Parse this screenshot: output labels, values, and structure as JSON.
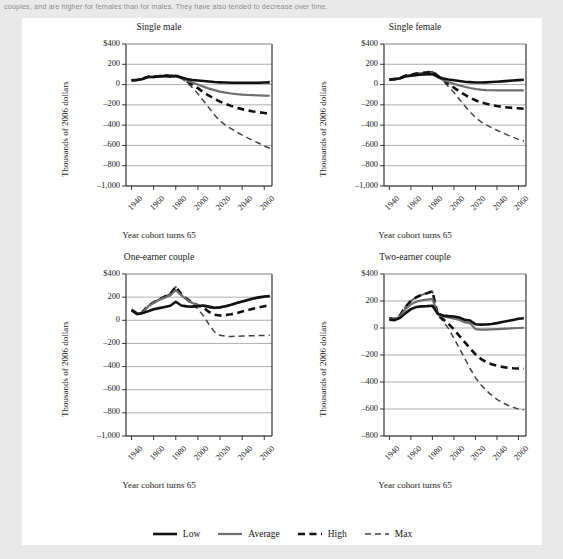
{
  "caption": "couples, and are higher for females than for males. They have also tended to decrease over time.",
  "colors": {
    "page_background": "#e9e9e9",
    "panel_background": "#ffffff",
    "low": "#111111",
    "average": "#6f6f6f",
    "high": "#111111",
    "max": "#444444",
    "gridline": "#9a9a9a",
    "axis": "#222222"
  },
  "legend": {
    "position": "bottom-center",
    "items": [
      {
        "label": "Low",
        "style": "solid",
        "width": 2.6,
        "color": "#111111"
      },
      {
        "label": "Average",
        "style": "solid",
        "width": 2.2,
        "color": "#6f6f6f"
      },
      {
        "label": "High",
        "style": "dashed",
        "width": 2.6,
        "color": "#111111"
      },
      {
        "label": "Max",
        "style": "dashed",
        "width": 1.5,
        "color": "#444444"
      }
    ]
  },
  "chart_data": [
    {
      "id": "single-male",
      "type": "line",
      "title": "Single male",
      "xlabel": "Year cohort turns 65",
      "ylabel": "Thousands of 2006 dollars",
      "grid": true,
      "xlim": [
        1935,
        2067
      ],
      "ylim": [
        -1000,
        400
      ],
      "yticks": [
        400,
        200,
        0,
        -200,
        -400,
        -600,
        -800,
        -1000
      ],
      "ytick_labels": [
        "$400",
        "200",
        "0",
        "–200",
        "–400",
        "–600",
        "–800",
        "–1,000"
      ],
      "xticks": [
        1940,
        1960,
        1980,
        2000,
        2020,
        2040,
        2060
      ],
      "xtick_labels": [
        "1940",
        "1960",
        "1980",
        "2000",
        "2020",
        "2040",
        "2060"
      ],
      "x": [
        1940,
        1945,
        1950,
        1955,
        1960,
        1965,
        1970,
        1975,
        1980,
        1985,
        1990,
        1995,
        2000,
        2005,
        2010,
        2015,
        2020,
        2025,
        2030,
        2035,
        2040,
        2045,
        2050,
        2055,
        2060,
        2065
      ],
      "series": [
        {
          "name": "Low",
          "style": "solid",
          "width": 2.6,
          "color": "#111111",
          "values": [
            40,
            45,
            55,
            75,
            75,
            80,
            85,
            80,
            85,
            70,
            55,
            45,
            40,
            35,
            30,
            25,
            22,
            20,
            18,
            18,
            18,
            18,
            18,
            18,
            20,
            22
          ]
        },
        {
          "name": "Average",
          "style": "solid",
          "width": 2.2,
          "color": "#6f6f6f",
          "values": [
            38,
            44,
            54,
            74,
            74,
            79,
            84,
            79,
            84,
            66,
            40,
            20,
            0,
            -20,
            -40,
            -55,
            -70,
            -80,
            -88,
            -95,
            -100,
            -103,
            -105,
            -107,
            -108,
            -110
          ]
        },
        {
          "name": "High",
          "style": "dashed",
          "width": 2.6,
          "color": "#111111",
          "values": [
            42,
            48,
            58,
            78,
            80,
            85,
            92,
            86,
            92,
            68,
            35,
            0,
            -35,
            -75,
            -110,
            -140,
            -168,
            -190,
            -210,
            -228,
            -242,
            -255,
            -265,
            -272,
            -280,
            -288
          ]
        },
        {
          "name": "Max",
          "style": "dashed",
          "width": 1.5,
          "color": "#444444",
          "values": [
            42,
            48,
            58,
            78,
            80,
            85,
            92,
            86,
            92,
            62,
            20,
            -30,
            -90,
            -160,
            -230,
            -300,
            -360,
            -400,
            -435,
            -468,
            -498,
            -525,
            -552,
            -578,
            -605,
            -628
          ]
        }
      ]
    },
    {
      "id": "single-female",
      "type": "line",
      "title": "Single female",
      "xlabel": "Year cohort turns 65",
      "ylabel": "Thousands of 2006 dollars",
      "grid": true,
      "xlim": [
        1935,
        2067
      ],
      "ylim": [
        -1000,
        400
      ],
      "yticks": [
        400,
        200,
        0,
        -200,
        -400,
        -600,
        -800,
        -1000
      ],
      "ytick_labels": [
        "$400",
        "200",
        "0",
        "–200",
        "–400",
        "–600",
        "–800",
        "–1,000"
      ],
      "xticks": [
        1940,
        1960,
        1980,
        2000,
        2020,
        2040,
        2060
      ],
      "xtick_labels": [
        "1940",
        "1960",
        "1980",
        "2000",
        "2020",
        "2040",
        "2060"
      ],
      "x": [
        1940,
        1945,
        1950,
        1955,
        1960,
        1965,
        1970,
        1975,
        1980,
        1985,
        1990,
        1995,
        2000,
        2005,
        2010,
        2015,
        2020,
        2025,
        2030,
        2035,
        2040,
        2045,
        2050,
        2055,
        2060,
        2065
      ],
      "series": [
        {
          "name": "Low",
          "style": "solid",
          "width": 2.6,
          "color": "#111111",
          "values": [
            48,
            52,
            62,
            82,
            88,
            95,
            100,
            102,
            105,
            78,
            60,
            50,
            42,
            35,
            28,
            24,
            20,
            20,
            22,
            25,
            28,
            32,
            36,
            40,
            44,
            48
          ]
        },
        {
          "name": "Average",
          "style": "solid",
          "width": 2.2,
          "color": "#6f6f6f",
          "values": [
            46,
            50,
            60,
            80,
            86,
            93,
            98,
            100,
            103,
            72,
            45,
            25,
            8,
            -8,
            -22,
            -34,
            -44,
            -50,
            -54,
            -56,
            -58,
            -58,
            -58,
            -58,
            -58,
            -58
          ]
        },
        {
          "name": "High",
          "style": "dashed",
          "width": 2.6,
          "color": "#111111",
          "values": [
            50,
            56,
            66,
            88,
            96,
            108,
            115,
            120,
            128,
            86,
            48,
            5,
            -30,
            -68,
            -100,
            -130,
            -155,
            -175,
            -190,
            -202,
            -212,
            -220,
            -226,
            -230,
            -234,
            -238
          ]
        },
        {
          "name": "Max",
          "style": "dashed",
          "width": 1.5,
          "color": "#444444",
          "values": [
            50,
            56,
            66,
            88,
            96,
            108,
            115,
            120,
            128,
            82,
            34,
            -20,
            -78,
            -145,
            -210,
            -270,
            -325,
            -365,
            -398,
            -425,
            -450,
            -475,
            -498,
            -520,
            -540,
            -558
          ]
        }
      ]
    },
    {
      "id": "one-earner-couple",
      "type": "line",
      "title": "One-earner couple",
      "xlabel": "Year cohort turns 65",
      "ylabel": "Thousands of 2006 dollars",
      "grid": true,
      "xlim": [
        1935,
        2067
      ],
      "ylim": [
        -1000,
        400
      ],
      "yticks": [
        400,
        200,
        0,
        -200,
        -400,
        -600,
        -800,
        -1000
      ],
      "ytick_labels": [
        "$400",
        "200",
        "0",
        "–200",
        "–400",
        "–600",
        "–800",
        "–1,000"
      ],
      "xticks": [
        1940,
        1960,
        1980,
        2000,
        2020,
        2040,
        2060
      ],
      "xtick_labels": [
        "1940",
        "1960",
        "1980",
        "2000",
        "2020",
        "2040",
        "2060"
      ],
      "x": [
        1940,
        1945,
        1950,
        1955,
        1960,
        1965,
        1970,
        1975,
        1980,
        1985,
        1990,
        1995,
        2000,
        2005,
        2010,
        2015,
        2020,
        2025,
        2030,
        2035,
        2040,
        2045,
        2050,
        2055,
        2060,
        2065
      ],
      "series": [
        {
          "name": "Low",
          "style": "solid",
          "width": 2.6,
          "color": "#111111",
          "values": [
            88,
            55,
            62,
            78,
            95,
            105,
            115,
            125,
            160,
            128,
            120,
            118,
            122,
            128,
            118,
            108,
            112,
            122,
            135,
            150,
            163,
            175,
            188,
            198,
            205,
            210
          ]
        },
        {
          "name": "Average",
          "style": "solid",
          "width": 2.2,
          "color": "#6f6f6f",
          "values": [
            85,
            52,
            68,
            120,
            150,
            175,
            195,
            215,
            262,
            215,
            178,
            150,
            132,
            122,
            112,
            104,
            110,
            120,
            133,
            148,
            161,
            173,
            186,
            196,
            203,
            208
          ]
        },
        {
          "name": "High",
          "style": "dashed",
          "width": 2.6,
          "color": "#111111",
          "values": [
            90,
            58,
            72,
            124,
            155,
            182,
            205,
            228,
            290,
            225,
            185,
            155,
            128,
            110,
            72,
            48,
            42,
            45,
            52,
            62,
            75,
            88,
            100,
            112,
            122,
            128
          ]
        },
        {
          "name": "Max",
          "style": "dashed",
          "width": 1.5,
          "color": "#444444",
          "values": [
            90,
            58,
            72,
            124,
            155,
            182,
            205,
            228,
            290,
            222,
            175,
            138,
            98,
            40,
            -35,
            -100,
            -130,
            -138,
            -140,
            -138,
            -136,
            -134,
            -133,
            -132,
            -131,
            -130
          ]
        }
      ]
    },
    {
      "id": "two-earner-couple",
      "type": "line",
      "title": "Two-earner couple",
      "xlabel": "Year cohort turns 65",
      "ylabel": "Thousands of 2006 dollars",
      "grid": true,
      "xlim": [
        1935,
        2067
      ],
      "ylim": [
        -800,
        400
      ],
      "yticks": [
        400,
        200,
        0,
        -200,
        -400,
        -600,
        -800
      ],
      "ytick_labels": [
        "$400",
        "200",
        "0",
        "–200",
        "–400",
        "–600",
        "–800"
      ],
      "xticks": [
        1940,
        1960,
        1980,
        2000,
        2020,
        2040,
        2060
      ],
      "xtick_labels": [
        "1940",
        "1960",
        "1980",
        "2000",
        "2020",
        "2040",
        "2060"
      ],
      "x": [
        1940,
        1945,
        1950,
        1955,
        1960,
        1965,
        1970,
        1975,
        1980,
        1985,
        1990,
        1995,
        2000,
        2005,
        2010,
        2015,
        2020,
        2025,
        2030,
        2035,
        2040,
        2045,
        2050,
        2055,
        2060,
        2065
      ],
      "series": [
        {
          "name": "Low",
          "style": "solid",
          "width": 2.6,
          "color": "#111111",
          "values": [
            62,
            58,
            75,
            110,
            140,
            155,
            160,
            162,
            165,
            105,
            92,
            88,
            85,
            78,
            60,
            55,
            28,
            25,
            26,
            30,
            36,
            44,
            52,
            60,
            68,
            72
          ]
        },
        {
          "name": "Average",
          "style": "solid",
          "width": 2.2,
          "color": "#6f6f6f",
          "values": [
            68,
            62,
            88,
            140,
            175,
            195,
            205,
            210,
            215,
            102,
            85,
            78,
            70,
            60,
            42,
            35,
            -8,
            -12,
            -12,
            -10,
            -8,
            -6,
            -4,
            -2,
            0,
            2
          ]
        },
        {
          "name": "High",
          "style": "dashed",
          "width": 2.6,
          "color": "#111111",
          "values": [
            72,
            66,
            95,
            158,
            200,
            228,
            245,
            258,
            272,
            98,
            65,
            30,
            -10,
            -58,
            -105,
            -150,
            -195,
            -228,
            -252,
            -268,
            -280,
            -288,
            -294,
            -298,
            -300,
            -302
          ]
        },
        {
          "name": "Max",
          "style": "dashed",
          "width": 1.5,
          "color": "#444444",
          "values": [
            72,
            66,
            95,
            158,
            200,
            228,
            245,
            258,
            272,
            95,
            50,
            -5,
            -75,
            -150,
            -225,
            -300,
            -368,
            -420,
            -462,
            -498,
            -528,
            -552,
            -572,
            -588,
            -600,
            -608
          ]
        }
      ]
    }
  ]
}
